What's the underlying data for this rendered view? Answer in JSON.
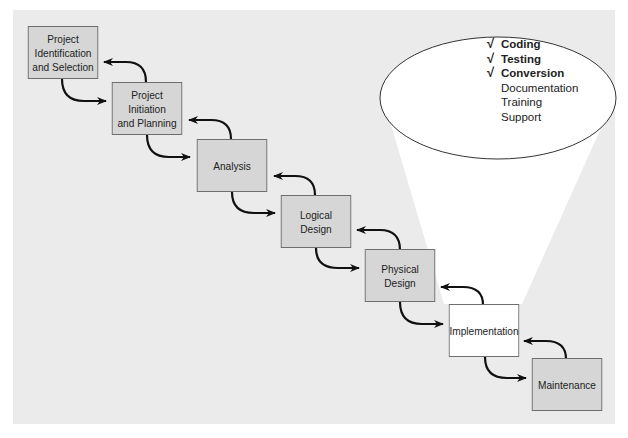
{
  "diagram": {
    "type": "waterfall-sdlc",
    "colors": {
      "panel_bg": "#ebebeb",
      "box_fill": "#d6d6d6",
      "highlight_fill": "#ffffff",
      "border": "#6e6e6e",
      "arrow": "#111111"
    },
    "phases": [
      {
        "id": "p1",
        "label": "Project\nIdentification\nand Selection"
      },
      {
        "id": "p2",
        "label": "Project\nInitiation\nand Planning"
      },
      {
        "id": "p3",
        "label": "Analysis"
      },
      {
        "id": "p4",
        "label": "Logical\nDesign"
      },
      {
        "id": "p5",
        "label": "Physical\nDesign"
      },
      {
        "id": "p6",
        "label": "Implementation",
        "highlighted": true
      },
      {
        "id": "p7",
        "label": "Maintenance"
      }
    ],
    "callout": {
      "attached_to": "Implementation",
      "check_symbol": "√",
      "items": [
        {
          "label": "Coding",
          "checked": true
        },
        {
          "label": "Testing",
          "checked": true
        },
        {
          "label": "Conversion",
          "checked": true
        },
        {
          "label": "Documentation",
          "checked": false
        },
        {
          "label": "Training",
          "checked": false
        },
        {
          "label": "Support",
          "checked": false
        }
      ]
    }
  }
}
